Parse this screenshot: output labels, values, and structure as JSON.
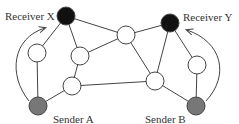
{
  "diagram": {
    "colors": {
      "edge": "#444444",
      "node_fill": "#ffffff",
      "node_stroke": "#444444",
      "receiver_fill": "#111111",
      "sender_fill": "#777777"
    },
    "nodes": [
      {
        "id": "rx",
        "kind": "receiver",
        "cx": 66,
        "cy": 16,
        "r": 9,
        "label": "Receiver X",
        "label_x": 5,
        "label_y": 20
      },
      {
        "id": "ry",
        "kind": "receiver",
        "cx": 170,
        "cy": 23,
        "r": 9,
        "label": "Receiver Y",
        "label_x": 183,
        "label_y": 21
      },
      {
        "id": "sa",
        "kind": "sender",
        "cx": 38,
        "cy": 106,
        "r": 9,
        "label": "Sender A",
        "label_x": 53,
        "label_y": 123
      },
      {
        "id": "sb",
        "kind": "sender",
        "cx": 196,
        "cy": 106,
        "r": 9,
        "label": "Sender B",
        "label_x": 145,
        "label_y": 123
      },
      {
        "id": "n1",
        "kind": "router",
        "cx": 126,
        "cy": 35,
        "r": 9,
        "label": ""
      },
      {
        "id": "n2",
        "kind": "router",
        "cx": 37,
        "cy": 53,
        "r": 9,
        "label": ""
      },
      {
        "id": "n3",
        "kind": "router",
        "cx": 80,
        "cy": 56,
        "r": 9,
        "label": ""
      },
      {
        "id": "n4",
        "kind": "router",
        "cx": 72,
        "cy": 86,
        "r": 9,
        "label": ""
      },
      {
        "id": "n5",
        "kind": "router",
        "cx": 155,
        "cy": 81,
        "r": 9,
        "label": ""
      },
      {
        "id": "n6",
        "kind": "router",
        "cx": 197,
        "cy": 65,
        "r": 9,
        "label": ""
      }
    ],
    "edges": [
      [
        "rx",
        "n2"
      ],
      [
        "rx",
        "n3"
      ],
      [
        "rx",
        "n1"
      ],
      [
        "n2",
        "sa"
      ],
      [
        "n3",
        "n1"
      ],
      [
        "n3",
        "n4"
      ],
      [
        "n4",
        "sa"
      ],
      [
        "n4",
        "n5"
      ],
      [
        "n1",
        "ry"
      ],
      [
        "n1",
        "n5"
      ],
      [
        "ry",
        "n5"
      ],
      [
        "ry",
        "n6"
      ],
      [
        "n6",
        "sb"
      ],
      [
        "n5",
        "sb"
      ]
    ],
    "arrows": [
      {
        "from": "sa",
        "to": "rx",
        "path": "M 29 101 C 8 75, 12 38, 45 28"
      },
      {
        "from": "sb",
        "to": "ry",
        "path": "M 206 101 C 230 75, 222 42, 187 30"
      }
    ]
  }
}
